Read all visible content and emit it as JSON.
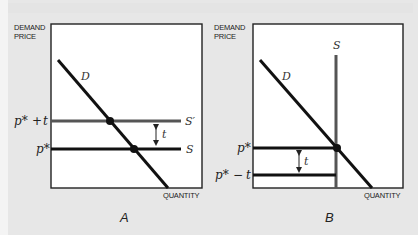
{
  "figure": {
    "panels": [
      {
        "id": "A",
        "panel_label": "A",
        "y_axis_label_line1": "DEMAND",
        "y_axis_label_line2": "PRICE",
        "x_axis_label": "QUANTITY",
        "demand_label": "D",
        "supply_label": "S",
        "supply_shifted_label": "S′",
        "price_upper_label_p": "p*",
        "price_upper_label_op": "+",
        "price_upper_label_t": "t",
        "price_lower_label": "p*",
        "tax_label": "t"
      },
      {
        "id": "B",
        "panel_label": "B",
        "y_axis_label_line1": "DEMAND",
        "y_axis_label_line2": "PRICE",
        "x_axis_label": "QUANTITY",
        "demand_label": "D",
        "supply_label": "S",
        "price_upper_label": "p*",
        "price_lower_label_p": "p*",
        "price_lower_label_op": "−",
        "price_lower_label_t": "t",
        "tax_label": "t"
      }
    ],
    "colors": {
      "background": "#e7e7e7",
      "plot_area": "#ffffff",
      "frame": "#222222",
      "demand_line": "#111111",
      "supply_line": "#111111",
      "supply_shifted_line": "#555555",
      "vertical_supply_line": "#555555",
      "points": "#111111"
    }
  }
}
